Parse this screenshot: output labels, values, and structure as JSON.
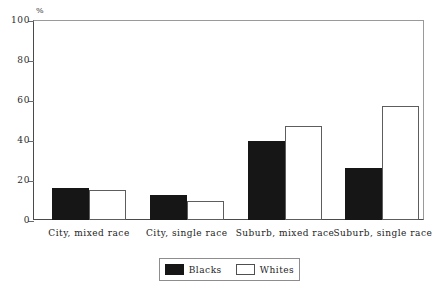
{
  "chart_data": {
    "type": "bar",
    "title": "",
    "xlabel": "",
    "ylabel": "%",
    "ylim": [
      0,
      100
    ],
    "yticks": [
      0,
      20,
      40,
      60,
      80,
      100
    ],
    "grid": false,
    "legend_position": "bottom-center",
    "categories": [
      "City, mixed race",
      "City, single race",
      "Suburb, mixed race",
      "Suburb, single race"
    ],
    "series": [
      {
        "name": "Blacks",
        "color": "#161616",
        "values": [
          16,
          12.5,
          39.5,
          26
        ]
      },
      {
        "name": "Whites",
        "color": "#ffffff",
        "values": [
          15,
          9.5,
          47,
          57
        ]
      }
    ]
  },
  "axis": {
    "unit_label": "%",
    "tick_labels": [
      "0",
      "20",
      "40",
      "60",
      "80",
      "100"
    ]
  },
  "legend": {
    "entries": [
      {
        "label": "Blacks",
        "swatch": "filled-black-swatch"
      },
      {
        "label": "Whites",
        "swatch": "outlined-white-swatch"
      }
    ]
  }
}
